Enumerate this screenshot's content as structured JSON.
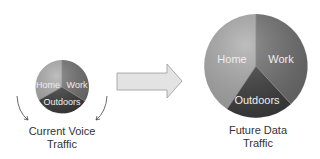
{
  "diagram": {
    "left_chart": {
      "caption_line1": "Current Voice",
      "caption_line2": "Traffic",
      "slices": [
        {
          "label": "Home",
          "color": "#a6a6a6"
        },
        {
          "label": "Work",
          "color": "#6e6e6e"
        },
        {
          "label": "Outdoors",
          "color": "#3e3e3e"
        }
      ]
    },
    "right_chart": {
      "caption_line1": "Future Data",
      "caption_line2": "Traffic",
      "slices": [
        {
          "label": "Home",
          "color": "#a6a6a6"
        },
        {
          "label": "Work",
          "color": "#6e6e6e"
        },
        {
          "label": "Outdoors",
          "color": "#3e3e3e"
        }
      ]
    },
    "arrow": {
      "fill": "#e2e2e2",
      "stroke": "#9a9a9a"
    },
    "label_color": "#eeeeee"
  }
}
